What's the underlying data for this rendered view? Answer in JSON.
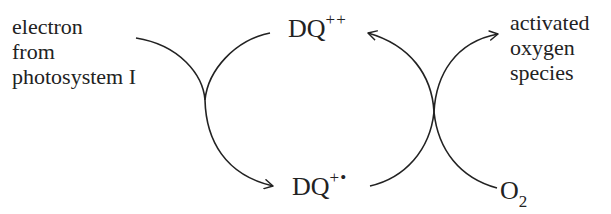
{
  "diagram": {
    "colors": {
      "ink": "#222222",
      "background": "#ffffff"
    },
    "labels": {
      "electron_source": [
        "electron",
        "from",
        "photosystem I"
      ],
      "product": [
        "activated",
        "oxygen",
        "species"
      ]
    },
    "species": {
      "dq_oxidized": {
        "base": "DQ",
        "charge": "++"
      },
      "dq_radical": {
        "base": "DQ",
        "charge": "+•"
      },
      "oxygen": {
        "base": "O",
        "subscript": "2"
      }
    },
    "arrows": [
      {
        "from": "electron from photosystem I",
        "to": "DQ+•",
        "via": "DQ++"
      },
      {
        "from": "O2",
        "to": "activated oxygen species",
        "via": "DQ+•"
      },
      {
        "from": "DQ+•",
        "to": "DQ++",
        "via": "O2 reduction"
      }
    ]
  }
}
